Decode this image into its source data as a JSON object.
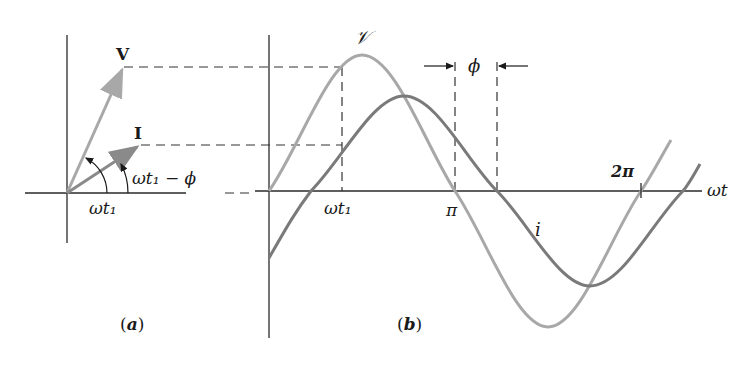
{
  "figure": {
    "panel_a": {
      "caption": "(a)",
      "caption_letter": "a",
      "phasor_v_label": "V",
      "phasor_i_label": "I",
      "angle_v_label": "ωt₁",
      "angle_i_label": "ωt₁ − ϕ"
    },
    "panel_b": {
      "caption": "(b)",
      "caption_letter": "b",
      "voltage_curve_label": "𝒱",
      "current_curve_label": "i",
      "x_axis_label": "ωt",
      "tick_wt1": "ωt₁",
      "tick_pi": "π",
      "tick_2pi": "2π",
      "phase_label": "ϕ"
    },
    "colors": {
      "axis": "#2a2a2a",
      "voltage": "#a8a8a8",
      "current": "#7a7a7a",
      "dash": "#333333",
      "text": "#1a1a1a"
    }
  }
}
